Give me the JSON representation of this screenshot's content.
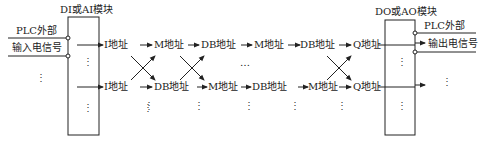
{
  "input_module": {
    "title": "DI或AI模块",
    "external_label": "PLC外部",
    "signal_label": "输入电信号",
    "dots": "⋮"
  },
  "output_module": {
    "title": "DO或AO模块",
    "external_label": "PLC外部",
    "signal_label": "输出电信号",
    "dots": "⋮"
  },
  "top_row": [
    "I地址",
    "M地址",
    "DB地址",
    "M地址",
    "DB地址",
    "Q地址"
  ],
  "bottom_row": [
    "I地址",
    "DB地址",
    "M地址",
    "DB地址",
    "M地址",
    "Q地址"
  ],
  "middle_ellipsis": "…",
  "colors": {
    "line": "#222222",
    "background": "#ffffff"
  }
}
